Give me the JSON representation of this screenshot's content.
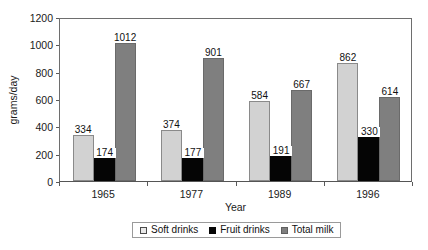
{
  "chart_data": {
    "type": "bar",
    "title": "",
    "xlabel": "Year",
    "ylabel": "grams/day",
    "categories": [
      "1965",
      "1977",
      "1989",
      "1996"
    ],
    "series": [
      {
        "name": "Soft drinks",
        "color": "#d2d2d2",
        "values": [
          334,
          374,
          584,
          862
        ]
      },
      {
        "name": "Fruit drinks",
        "color": "#050505",
        "values": [
          174,
          177,
          191,
          330
        ]
      },
      {
        "name": "Total milk",
        "color": "#7f7f7f",
        "values": [
          1012,
          901,
          667,
          614
        ]
      }
    ],
    "ylim": [
      0,
      1200
    ],
    "ytick_step": 200,
    "yticks": [
      "1200",
      "1000",
      "800",
      "600",
      "400",
      "200",
      "0"
    ],
    "grid": false,
    "legend_position": "bottom",
    "data_labels": true
  },
  "axes": {
    "y_title": "grams/day",
    "x_title": "Year"
  },
  "legend": {
    "items": [
      {
        "label": "Soft drinks"
      },
      {
        "label": "Fruit drinks"
      },
      {
        "label": "Total milk"
      }
    ]
  }
}
